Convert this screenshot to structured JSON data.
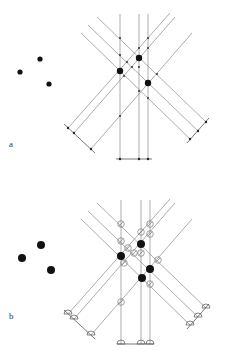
{
  "panels": [
    {
      "label": "a",
      "label_pos": [
        9,
        146
      ],
      "source_points": [
        [
          20,
          72
        ],
        [
          40,
          59
        ],
        [
          49,
          84
        ]
      ],
      "source_radius": 2.6,
      "recon_points": [
        [
          120,
          71
        ],
        [
          139,
          58
        ],
        [
          148,
          83
        ]
      ],
      "recon_radius": 3.2,
      "vertical_x": [
        120,
        139,
        148
      ],
      "vertical_top": 14,
      "vertical_bottom": 159,
      "marker_style": "tick"
    },
    {
      "label": "b",
      "label_pos": [
        9,
        318
      ],
      "source_points": [
        [
          22,
          258
        ],
        [
          41,
          245
        ],
        [
          51,
          270
        ]
      ],
      "source_radius": 4,
      "recon_points": [
        [
          121,
          256
        ],
        [
          141,
          244
        ],
        [
          150,
          269
        ],
        [
          142,
          278
        ]
      ],
      "recon_radius": 4,
      "vertical_x": [
        121,
        141,
        150
      ],
      "vertical_top": 200,
      "vertical_bottom": 344,
      "marker_style": "detector"
    }
  ],
  "colors": {
    "line": "#8a8a8a",
    "dot": "#111111",
    "background": "#ffffff"
  }
}
